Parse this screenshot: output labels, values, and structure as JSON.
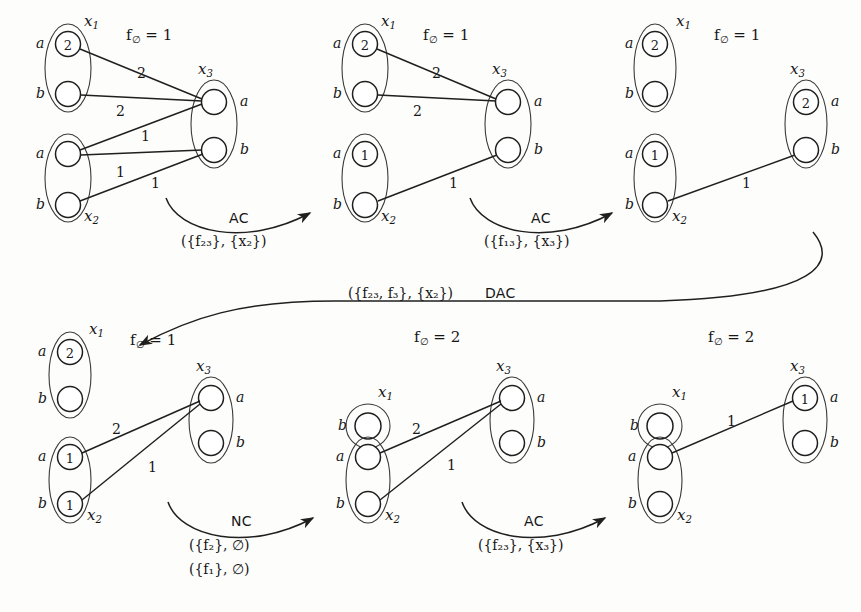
{
  "figure": {
    "symbols": {
      "f_empty": "f",
      "f_empty_sub": "∅",
      "equals": "=",
      "emptyset": "∅"
    }
  },
  "diagrams": [
    {
      "id": "d1",
      "position": "top-left",
      "cost_label": "f",
      "cost_sub": "∅",
      "cost_value": "1",
      "cost_text": "= 1",
      "variables": [
        {
          "name": "x",
          "sub": "1",
          "label_side": "top-right",
          "ports": [
            "a",
            "b"
          ],
          "port_side": "left",
          "values": [
            "2",
            ""
          ]
        },
        {
          "name": "x",
          "sub": "2",
          "label_side": "bottom-right",
          "ports": [
            "a",
            "b"
          ],
          "port_side": "left",
          "values": [
            "",
            ""
          ]
        },
        {
          "name": "x",
          "sub": "3",
          "label_side": "top-left",
          "ports": [
            "a",
            "b"
          ],
          "port_side": "right",
          "values": [
            "",
            ""
          ]
        }
      ],
      "edges": [
        {
          "from": "x1.a",
          "to": "x3.a",
          "weight": "2"
        },
        {
          "from": "x1.b",
          "to": "x3.a",
          "weight": "2"
        },
        {
          "from": "x2.a",
          "to": "x3.a",
          "weight": "1"
        },
        {
          "from": "x2.a",
          "to": "x3.b",
          "weight": "1"
        },
        {
          "from": "x2.b",
          "to": "x3.b",
          "weight": "1"
        }
      ]
    },
    {
      "id": "d2",
      "position": "top-middle",
      "cost_label": "f",
      "cost_sub": "∅",
      "cost_value": "1",
      "cost_text": "= 1",
      "variables": [
        {
          "name": "x",
          "sub": "1",
          "ports": [
            "a",
            "b"
          ],
          "values": [
            "2",
            ""
          ]
        },
        {
          "name": "x",
          "sub": "2",
          "ports": [
            "a",
            "b"
          ],
          "values": [
            "1",
            ""
          ]
        },
        {
          "name": "x",
          "sub": "3",
          "ports": [
            "a",
            "b"
          ],
          "values": [
            "",
            ""
          ]
        }
      ],
      "edges": [
        {
          "from": "x1.a",
          "to": "x3.a",
          "weight": "2"
        },
        {
          "from": "x1.b",
          "to": "x3.a",
          "weight": "2"
        },
        {
          "from": "x2.b",
          "to": "x3.b",
          "weight": "1"
        }
      ]
    },
    {
      "id": "d3",
      "position": "top-right",
      "cost_label": "f",
      "cost_sub": "∅",
      "cost_value": "1",
      "cost_text": "= 1",
      "variables": [
        {
          "name": "x",
          "sub": "1",
          "ports": [
            "a",
            "b"
          ],
          "values": [
            "2",
            ""
          ]
        },
        {
          "name": "x",
          "sub": "2",
          "ports": [
            "a",
            "b"
          ],
          "values": [
            "1",
            ""
          ]
        },
        {
          "name": "x",
          "sub": "3",
          "ports": [
            "a",
            "b"
          ],
          "values": [
            "2",
            ""
          ]
        }
      ],
      "edges": [
        {
          "from": "x2.b",
          "to": "x3.b",
          "weight": "1"
        }
      ]
    },
    {
      "id": "d4",
      "position": "bottom-left",
      "cost_label": "f",
      "cost_sub": "∅",
      "cost_value": "1",
      "cost_text": "= 1",
      "variables": [
        {
          "name": "x",
          "sub": "1",
          "ports": [
            "a",
            "b"
          ],
          "values": [
            "2",
            ""
          ]
        },
        {
          "name": "x",
          "sub": "2",
          "ports": [
            "a",
            "b"
          ],
          "values": [
            "1",
            "1"
          ]
        },
        {
          "name": "x",
          "sub": "3",
          "ports": [
            "a",
            "b"
          ],
          "values": [
            "",
            ""
          ]
        }
      ],
      "edges": [
        {
          "from": "x2.a",
          "to": "x3.a",
          "weight": "2"
        },
        {
          "from": "x2.b",
          "to": "x3.a",
          "weight": "1"
        }
      ]
    },
    {
      "id": "d5",
      "position": "bottom-middle",
      "cost_label": "f",
      "cost_sub": "∅",
      "cost_value": "2",
      "cost_text": "= 2",
      "variables": [
        {
          "name": "x",
          "sub": "1",
          "ports": [
            "b"
          ],
          "values": [
            ""
          ],
          "single": true
        },
        {
          "name": "x",
          "sub": "2",
          "ports": [
            "a",
            "b"
          ],
          "values": [
            "",
            ""
          ]
        },
        {
          "name": "x",
          "sub": "3",
          "ports": [
            "a",
            "b"
          ],
          "values": [
            "",
            ""
          ]
        }
      ],
      "edges": [
        {
          "from": "x2.a",
          "to": "x3.a",
          "weight": "2"
        },
        {
          "from": "x2.b",
          "to": "x3.a",
          "weight": "1"
        }
      ]
    },
    {
      "id": "d6",
      "position": "bottom-right",
      "cost_label": "f",
      "cost_sub": "∅",
      "cost_value": "2",
      "cost_text": "= 2",
      "variables": [
        {
          "name": "x",
          "sub": "1",
          "ports": [
            "b"
          ],
          "values": [
            ""
          ],
          "single": true
        },
        {
          "name": "x",
          "sub": "2",
          "ports": [
            "a",
            "b"
          ],
          "values": [
            "",
            ""
          ]
        },
        {
          "name": "x",
          "sub": "3",
          "ports": [
            "a",
            "b"
          ],
          "values": [
            "1",
            ""
          ]
        }
      ],
      "edges": [
        {
          "from": "x2.a",
          "to": "x3.a",
          "weight": "1"
        }
      ]
    }
  ],
  "transitions": [
    {
      "id": "t1",
      "op": "AC",
      "arg": "({f₂₃}, {x₂})",
      "arg_parts": {
        "prefix": "({",
        "fname": "f",
        "fsub": "23",
        "mid": "}, {",
        "vname": "x",
        "vsub": "2",
        "suffix": "})"
      },
      "from_diagram": "d1",
      "to_diagram": "d2"
    },
    {
      "id": "t2",
      "op": "AC",
      "arg": "({f₁₃}, {x₃})",
      "arg_parts": {
        "prefix": "({",
        "fname": "f",
        "fsub": "13",
        "mid": "}, {",
        "vname": "x",
        "vsub": "3",
        "suffix": "})"
      },
      "from_diagram": "d2",
      "to_diagram": "d3"
    },
    {
      "id": "t3",
      "op": "DAC",
      "arg": "({f₂₃, f₃}, {x₂})",
      "arg_parts": {
        "prefix": "({",
        "fname": "f",
        "fsub": "23",
        "mid2": ", ",
        "fname2": "f",
        "fsub2": "3",
        "mid": "}, {",
        "vname": "x",
        "vsub": "2",
        "suffix": "})"
      },
      "from_diagram": "d3",
      "to_diagram": "d4"
    },
    {
      "id": "t4",
      "op": "NC",
      "arg_line1": "({f₂}, ∅)",
      "arg_line2": "({f₁}, ∅)",
      "from_diagram": "d4",
      "to_diagram": "d5"
    },
    {
      "id": "t5",
      "op": "AC",
      "arg": "({f₂₃}, {x₃})",
      "arg_parts": {
        "prefix": "({",
        "fname": "f",
        "fsub": "23",
        "mid": "}, {",
        "vname": "x",
        "vsub": "3",
        "suffix": "})"
      },
      "from_diagram": "d5",
      "to_diagram": "d6"
    }
  ],
  "colors": {
    "ink": "#1f1f1f",
    "paper": "#fdfdfc",
    "ellipse": "#3a3a3a"
  }
}
